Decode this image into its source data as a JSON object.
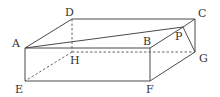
{
  "diagram": {
    "type": "rectangular-prism",
    "colors": {
      "line": "#4a4a4a",
      "label": "#333333",
      "background": "#ffffff"
    },
    "vertices": {
      "A": {
        "label": "A",
        "x": 25,
        "y": 48,
        "lx": 12,
        "ly": 47
      },
      "B": {
        "label": "B",
        "x": 150,
        "y": 48,
        "lx": 143,
        "ly": 45
      },
      "C": {
        "label": "C",
        "x": 195,
        "y": 19,
        "lx": 198,
        "ly": 17
      },
      "D": {
        "label": "D",
        "x": 72,
        "y": 19,
        "lx": 65,
        "ly": 16
      },
      "E": {
        "label": "E",
        "x": 25,
        "y": 81,
        "lx": 15,
        "ly": 93
      },
      "F": {
        "label": "F",
        "x": 150,
        "y": 81,
        "lx": 146,
        "ly": 93
      },
      "G": {
        "label": "G",
        "x": 195,
        "y": 52,
        "lx": 199,
        "ly": 62
      },
      "H": {
        "label": "H",
        "x": 72,
        "y": 52,
        "lx": 70,
        "ly": 64
      },
      "P": {
        "label": "P",
        "x": 183,
        "y": 27,
        "lx": 179,
        "ly": 40
      }
    },
    "solid_edges": [
      [
        "A",
        "D"
      ],
      [
        "D",
        "C"
      ],
      [
        "A",
        "B"
      ],
      [
        "A",
        "P"
      ],
      [
        "B",
        "P"
      ],
      [
        "P",
        "C"
      ],
      [
        "P",
        "G"
      ],
      [
        "C",
        "G"
      ],
      [
        "A",
        "E"
      ],
      [
        "B",
        "F"
      ],
      [
        "E",
        "F"
      ],
      [
        "F",
        "G"
      ]
    ],
    "hidden_edges": [
      [
        "D",
        "H"
      ],
      [
        "H",
        "E"
      ],
      [
        "H",
        "G"
      ]
    ]
  }
}
